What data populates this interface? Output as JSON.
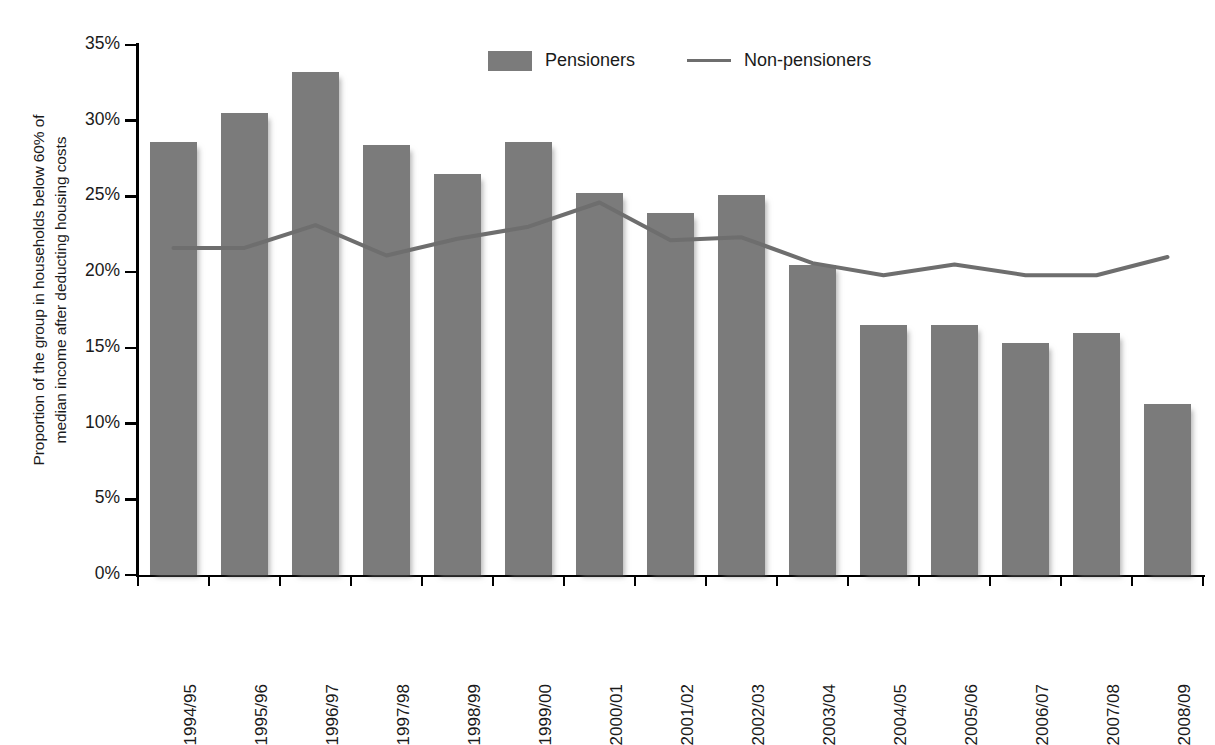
{
  "chart_data": {
    "type": "bar",
    "title": "",
    "xlabel": "",
    "ylabel": "Proportion of the group in households below 60% of median income after deducting housing costs",
    "ylabel_lines": [
      "Proportion of the group in households below 60% of",
      "median income after deducting housing costs"
    ],
    "categories": [
      "1994/95",
      "1995/96",
      "1996/97",
      "1997/98",
      "1998/99",
      "1999/00",
      "2000/01",
      "2001/02",
      "2002/03",
      "2003/04",
      "2004/05",
      "2005/06",
      "2006/07",
      "2007/08",
      "2008/09"
    ],
    "series": [
      {
        "name": "Pensioners",
        "type": "bar",
        "color": "#7b7b7b",
        "values": [
          28.6,
          30.5,
          33.2,
          28.4,
          26.5,
          28.6,
          25.2,
          23.9,
          25.1,
          20.5,
          16.5,
          16.5,
          15.3,
          16.0,
          11.3
        ]
      },
      {
        "name": "Non-pensioners",
        "type": "line",
        "color": "#6e6e6e",
        "values": [
          21.6,
          21.6,
          23.1,
          21.1,
          22.2,
          23.0,
          24.6,
          22.1,
          22.3,
          20.6,
          19.8,
          20.5,
          19.8,
          19.8,
          21.0
        ]
      }
    ],
    "ylim": [
      0,
      35
    ],
    "yticks": [
      0,
      5,
      10,
      15,
      20,
      25,
      30,
      35
    ],
    "ytick_labels": [
      "0%",
      "5%",
      "10%",
      "15%",
      "20%",
      "25%",
      "30%",
      "35%"
    ],
    "grid": false,
    "legend_position": "top-center",
    "legend": [
      {
        "label": "Pensioners",
        "marker": "bar-swatch",
        "color": "#7b7b7b"
      },
      {
        "label": "Non-pensioners",
        "marker": "line-swatch",
        "color": "#6e6e6e"
      }
    ]
  }
}
